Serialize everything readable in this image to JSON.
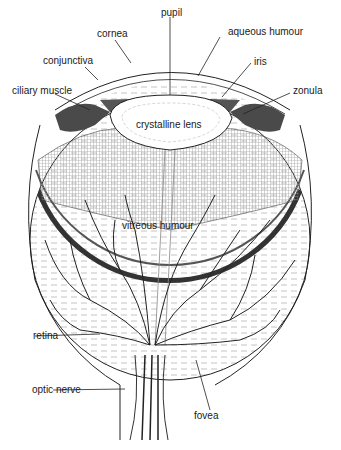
{
  "labels": {
    "pupil": "pupil",
    "cornea": "cornea",
    "aqueous_humour": "aqueous humour",
    "conjunctiva": "conjunctiva",
    "iris": "iris",
    "ciliary_muscle": "ciliary muscle",
    "zonula": "zonula",
    "crystalline_lens": "crystalline lens",
    "vitreous_humour": "vitreous humour",
    "retina": "retina",
    "optic_nerve": "optic nerve",
    "fovea": "fovea"
  },
  "colors": {
    "ink": "#1a1a1a",
    "background": "#ffffff",
    "muscle": "#4a4a4a"
  }
}
